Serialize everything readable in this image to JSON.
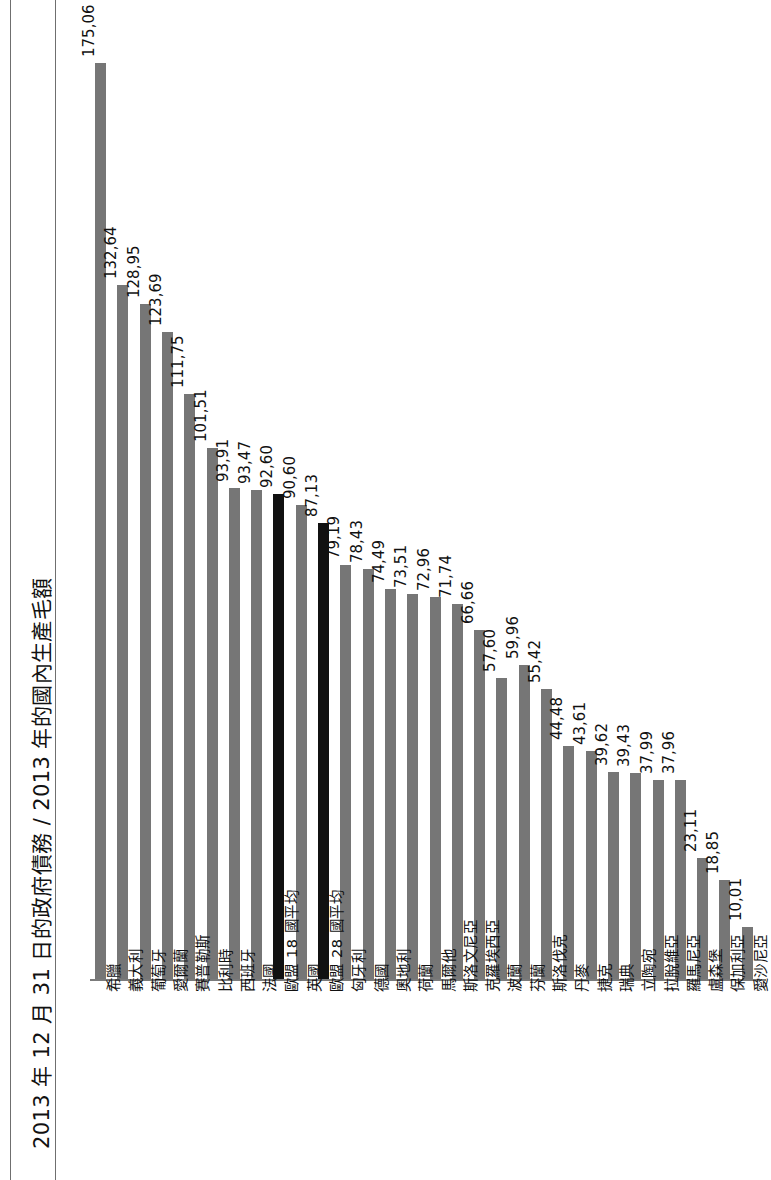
{
  "title": "2013 年 12 月 31 日的政府債務 / 2013 年的國內生產毛額",
  "colors": {
    "bar": "#767676",
    "bar_highlight": "#111111",
    "axis": "#7b7b7b",
    "text": "#111111",
    "background": "#ffffff"
  },
  "chart_data": {
    "type": "bar",
    "title": "2013 年 12 月 31 日的政府債務 / 2013 年的國內生產毛額",
    "xlabel": "",
    "ylabel": "",
    "ylim": [
      0,
      175.06
    ],
    "grid": false,
    "legend": null,
    "orientation": "vertical",
    "value_format": "comma-decimal",
    "categories": [
      "希臘",
      "義大利",
      "葡萄牙",
      "愛爾蘭",
      "賽普勒斯",
      "比利時",
      "西班牙",
      "法國",
      "歐盟 18 國平均",
      "英國",
      "歐盟 28 國平均",
      "匈牙利",
      "德國",
      "奧地利",
      "荷蘭",
      "馬爾他",
      "斯洛文尼亞",
      "克羅埃西亞",
      "波蘭",
      "芬蘭",
      "斯洛伐克",
      "丹麥",
      "捷克",
      "瑞典",
      "立陶宛",
      "拉脫維亞",
      "羅馬尼亞",
      "盧森堡",
      "保加利亞",
      "愛沙尼亞"
    ],
    "values": [
      175.06,
      132.64,
      128.95,
      123.69,
      111.75,
      101.51,
      93.91,
      93.47,
      92.6,
      90.6,
      87.13,
      79.19,
      78.43,
      74.49,
      73.51,
      72.96,
      71.74,
      66.66,
      57.6,
      59.96,
      55.42,
      44.48,
      43.61,
      39.62,
      39.43,
      37.99,
      37.96,
      23.11,
      18.85,
      10.01
    ],
    "value_labels": [
      "175,06",
      "132,64",
      "128,95",
      "123,69",
      "111,75",
      "101,51",
      "93,91",
      "93,47",
      "92,60",
      "90,60",
      "87,13",
      "79,19",
      "78,43",
      "74,49",
      "73,51",
      "72,96",
      "71,74",
      "66,66",
      "57,60",
      "59,96",
      "55,42",
      "44,48",
      "43,61",
      "39,62",
      "39,43",
      "37,99",
      "37,96",
      "23,11",
      "18,85",
      "10,01"
    ],
    "highlighted_indices": [
      8,
      10
    ],
    "highlight_note": "歐盟 18 國平均 與 歐盟 28 國平均 以黑色強調"
  }
}
